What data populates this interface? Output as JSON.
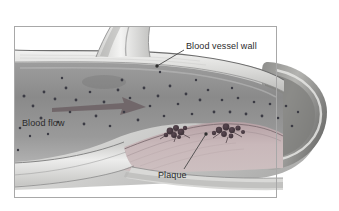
{
  "figure": {
    "type": "medical-illustration",
    "frame": {
      "visible": true,
      "x": 14,
      "y": 26,
      "width": 263,
      "height": 172,
      "color": "#a8a8a8"
    },
    "background_color": "#ffffff"
  },
  "labels": {
    "vessel_wall": "Blood vessel wall",
    "blood_flow": "Blood flow",
    "plaque": "Plaque"
  },
  "leaders": [
    {
      "name": "vessel-wall-leader",
      "from": [
        184,
        50
      ],
      "to": [
        157,
        66
      ],
      "dot": [
        157,
        66
      ]
    },
    {
      "name": "plaque-leader",
      "from": [
        184,
        169
      ],
      "to": [
        206,
        134
      ],
      "dot": [
        206,
        134
      ]
    }
  ],
  "arrow": {
    "name": "blood-flow-arrow",
    "direction": "right",
    "start": [
      52,
      106
    ],
    "end": [
      146,
      106
    ],
    "color": "#6f6467"
  },
  "colors": {
    "lumen": "#8e8e8e",
    "lumen_light": "#b9b9b9",
    "vessel_wall": "#e3e3e1",
    "wall_outline": "#6d6d6d",
    "plaque": "#c4b3b5",
    "plaque_dark": "#9b8287",
    "plaque_cluster": "#4a3b40",
    "blood_cell": "#3b3b44",
    "outer_wall": "#9a9a98",
    "label_text": "#2b2b2b",
    "frame": "#a8a8a8"
  },
  "features": [
    {
      "name": "branch-vessel",
      "description": "smaller vessel branching upward out of frame"
    },
    {
      "name": "plaque-cluster-left",
      "x": 176,
      "y": 130
    },
    {
      "name": "plaque-cluster-right",
      "x": 227,
      "y": 131
    },
    {
      "name": "vessel-bulb-end",
      "x": 300,
      "y": 110,
      "description": "rounded cut-away end of vessel"
    }
  ]
}
